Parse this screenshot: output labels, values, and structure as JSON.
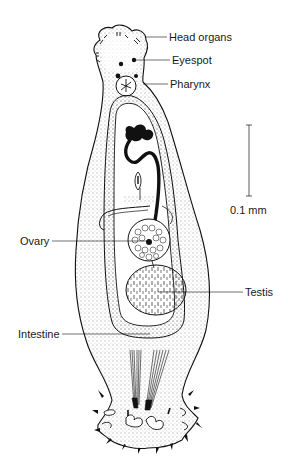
{
  "figure": {
    "labels": {
      "head_organs": "Head organs",
      "eyespot": "Eyespot",
      "pharynx": "Pharynx",
      "ovary": "Ovary",
      "testis": "Testis",
      "intestine": "Intestine"
    },
    "scale_bar": {
      "label": "0.1 mm"
    },
    "colors": {
      "ink": "#111111",
      "background": "#ffffff"
    }
  }
}
